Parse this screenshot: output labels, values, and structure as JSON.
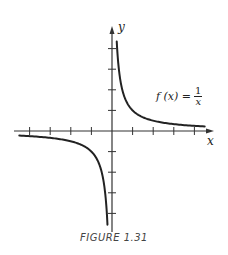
{
  "chart_data": {
    "type": "line",
    "title": "",
    "function_label": "f(x) = 1/x",
    "xlabel": "x",
    "ylabel": "y",
    "xlim": [
      -4.5,
      4.5
    ],
    "ylim": [
      -4.6,
      4.4
    ],
    "x_ticks": [
      -4,
      -3,
      -2,
      -1,
      1,
      2,
      3,
      4
    ],
    "y_ticks": [
      -4,
      -3,
      -2,
      -1,
      1,
      2,
      3,
      4
    ],
    "tick_labels_shown": false,
    "grid": false,
    "legend": null,
    "series": [
      {
        "name": "f(x) = 1/x, x > 0",
        "x": [
          0.23,
          0.3,
          0.4,
          0.5,
          0.75,
          1,
          1.5,
          2,
          3,
          4.5
        ],
        "y": [
          4.35,
          3.33,
          2.5,
          2,
          1.33,
          1,
          0.67,
          0.5,
          0.33,
          0.22
        ]
      },
      {
        "name": "f(x) = 1/x, x < 0",
        "x": [
          -4.5,
          -4,
          -3,
          -2,
          -1.5,
          -1,
          -0.75,
          -0.5,
          -0.4,
          -0.3,
          -0.22
        ],
        "y": [
          -0.22,
          -0.25,
          -0.33,
          -0.5,
          -0.67,
          -1,
          -1.33,
          -2,
          -2.5,
          -3.33,
          -4.55
        ]
      }
    ],
    "caption": "FIGURE 1.31"
  },
  "labels": {
    "x_axis": "x",
    "y_axis": "y",
    "fn_prefix": "f (x) =",
    "fn_num": "1",
    "fn_den": "x",
    "caption": "FIGURE 1.31"
  },
  "colors": {
    "axis": "#333333",
    "curve": "#222222"
  }
}
